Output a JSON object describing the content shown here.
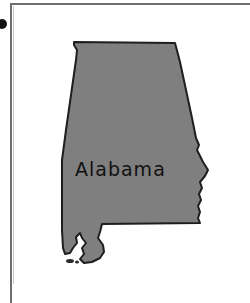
{
  "map": {
    "state_name": "Alabama",
    "fill_color": "#7f7f7f",
    "outline_color": "#1e1e1e",
    "frame_color": "#6f6f6f",
    "background_color": "#ffffff"
  }
}
